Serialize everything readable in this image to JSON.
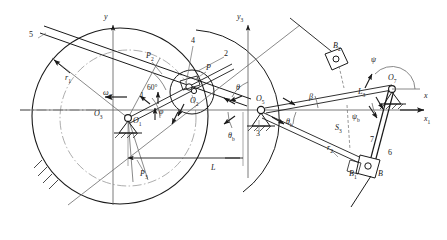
{
  "figure": {
    "kind": "kinematic-linkage-diagram",
    "width": 447,
    "height": 240,
    "background": "#ffffff",
    "line_color": "#1a1a1a",
    "thin_color": "#6b6b6b",
    "label_color": "#1a1a1a"
  },
  "axes": [
    {
      "id": "y",
      "label": "y",
      "sub": "",
      "x": 110,
      "y": 17,
      "dir": "up",
      "desc": "vertical axis through O1"
    },
    {
      "id": "y3",
      "label": "y",
      "sub": "3",
      "x": 243,
      "y": 17,
      "dir": "up",
      "desc": "vertical axis through O5"
    },
    {
      "id": "x",
      "label": "x",
      "sub": "",
      "x": 424,
      "y": 96,
      "dir": "right",
      "desc": "horizontal axis upper"
    },
    {
      "id": "x1",
      "label": "x",
      "sub": "1",
      "x": 424,
      "y": 122,
      "dir": "right",
      "desc": "horizontal axis lower"
    }
  ],
  "joints": [
    {
      "id": "O3",
      "label": "O",
      "sub": "3",
      "x": 98,
      "y": 114,
      "type": "point-label-left"
    },
    {
      "id": "O1",
      "label": "O",
      "sub": "1",
      "x": 128,
      "y": 118,
      "type": "fixed-pivot"
    },
    {
      "id": "O2",
      "label": "O",
      "sub": "2",
      "x": 196,
      "y": 98,
      "type": "revolute-on-disc"
    },
    {
      "id": "O5",
      "label": "O",
      "sub": "5",
      "x": 262,
      "y": 101,
      "type": "fixed-pivot"
    },
    {
      "id": "O7",
      "label": "O",
      "sub": "7",
      "x": 395,
      "y": 82,
      "type": "fixed-pivot"
    }
  ],
  "points": [
    {
      "id": "P",
      "label": "P",
      "sub": "",
      "x": 208,
      "y": 68
    },
    {
      "id": "P2",
      "label": "P",
      "sub": "2",
      "x": 150,
      "y": 56
    },
    {
      "id": "P3",
      "label": "P",
      "sub": "3",
      "x": 143,
      "y": 174
    },
    {
      "id": "B",
      "label": "B",
      "sub": "",
      "x": 381,
      "y": 172
    },
    {
      "id": "B1",
      "label": "B",
      "sub": "1",
      "x": 355,
      "y": 172
    },
    {
      "id": "B2",
      "label": "B",
      "sub": "2",
      "x": 337,
      "y": 47
    },
    {
      "id": "S3",
      "label": "S",
      "sub": "3",
      "x": 340,
      "y": 130
    }
  ],
  "link_numbers": [
    {
      "id": "n5",
      "label": "5",
      "x": 31,
      "y": 35
    },
    {
      "id": "n4",
      "label": "4",
      "x": 194,
      "y": 40
    },
    {
      "id": "n2",
      "label": "2",
      "x": 226,
      "y": 53
    },
    {
      "id": "n1",
      "label": "1",
      "x": 139,
      "y": 95
    },
    {
      "id": "n3",
      "label": "3",
      "x": 258,
      "y": 133
    },
    {
      "id": "n6",
      "label": "6",
      "x": 390,
      "y": 153
    },
    {
      "id": "n7",
      "label": "7",
      "x": 372,
      "y": 140
    }
  ],
  "dimensions": [
    {
      "id": "r1",
      "label": "r",
      "sub": "1",
      "x": 68,
      "y": 78
    },
    {
      "id": "r2",
      "label": "r",
      "sub": "2",
      "x": 330,
      "y": 148
    },
    {
      "id": "L",
      "label": "L",
      "sub": "",
      "x": 213,
      "y": 168
    },
    {
      "id": "L3",
      "label": "L",
      "sub": "3",
      "x": 362,
      "y": 92
    }
  ],
  "angles": [
    {
      "id": "omega1",
      "glyph": "ω",
      "sub": "1",
      "x": 107,
      "y": 93,
      "desc": "input angular velocity at O1"
    },
    {
      "id": "phi",
      "glyph": "φ",
      "sub": "",
      "x": 161,
      "y": 112,
      "desc": "crank angle"
    },
    {
      "id": "deg60",
      "glyph": "60°",
      "sub": "",
      "x": 151,
      "y": 88,
      "desc": "60 degree offset"
    },
    {
      "id": "theta",
      "glyph": "θ",
      "sub": "",
      "x": 238,
      "y": 88,
      "desc": "angle at O5 upper"
    },
    {
      "id": "beta",
      "glyph": "β",
      "sub": "",
      "x": 311,
      "y": 97,
      "desc": "angle of link L3"
    },
    {
      "id": "thetab1",
      "glyph": "θ",
      "sub": "b",
      "x": 288,
      "y": 122,
      "desc": "theta b right of O5"
    },
    {
      "id": "thetab2",
      "glyph": "θ",
      "sub": "b",
      "x": 232,
      "y": 136,
      "desc": "theta b left of O5"
    },
    {
      "id": "psi",
      "glyph": "ψ",
      "sub": "",
      "x": 373,
      "y": 60,
      "desc": "rocker angle at O7"
    },
    {
      "id": "psib",
      "glyph": "ψ",
      "sub": "b",
      "x": 355,
      "y": 117,
      "desc": "psi b at O7"
    }
  ]
}
